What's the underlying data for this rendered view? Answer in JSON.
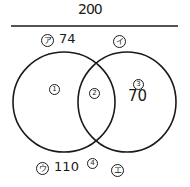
{
  "diagram": {
    "type": "venn",
    "total": "200",
    "set_labels": {
      "left_top": {
        "mark": "ア",
        "value": "74"
      },
      "right_top": {
        "mark": "イ",
        "value": ""
      },
      "left_bottom": {
        "mark": "ウ",
        "value": "110"
      },
      "right_bottom": {
        "mark": "エ",
        "value": ""
      }
    },
    "regions": [
      {
        "id": "1",
        "mark": "1",
        "value": ""
      },
      {
        "id": "2",
        "mark": "2",
        "value": ""
      },
      {
        "id": "3",
        "mark": "3",
        "value": "70"
      },
      {
        "id": "4",
        "mark": "4",
        "value": ""
      }
    ],
    "colors": {
      "ink": "#1a1a1a",
      "background": "#ffffff"
    }
  }
}
